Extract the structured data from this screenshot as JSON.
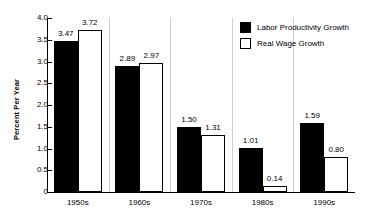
{
  "chart_data": {
    "type": "bar",
    "title": "",
    "subtitle": "",
    "xlabel": "",
    "ylabel": "Percent Per Year",
    "ylim": [
      0,
      4.0
    ],
    "ytick_values": [
      4.0,
      3.5,
      3.0,
      2.5,
      2.0,
      1.5,
      1.0,
      0.5,
      0
    ],
    "ytick_labels": [
      "4.0",
      "3.5",
      "3.0",
      "2.5",
      "2.0",
      "1.5",
      "1.0",
      "0.5",
      "0"
    ],
    "grid": false,
    "legend_position": "top-right",
    "categories": [
      "1950s",
      "1960s",
      "1970s",
      "1980s",
      "1990s"
    ],
    "series": [
      {
        "name": "Labor Productivity Growth",
        "color": "#000000",
        "fill": "solid",
        "values": [
          3.47,
          2.89,
          1.5,
          1.01,
          1.59
        ],
        "labels": [
          "3.47",
          "2.89",
          "1.50",
          "1.01",
          "1.59"
        ]
      },
      {
        "name": "Real Wage Growth",
        "color": "#ffffff",
        "fill": "outline",
        "values": [
          3.72,
          2.97,
          1.31,
          0.14,
          0.8
        ],
        "labels": [
          "3.72",
          "2.97",
          "1.31",
          "0.14",
          "0.80"
        ]
      }
    ]
  },
  "legend": {
    "items": [
      {
        "label": "Labor Productivity Growth",
        "swatch": "dark"
      },
      {
        "label": "Real Wage Growth",
        "swatch": "light"
      }
    ]
  },
  "colors": {
    "axis": "#000000",
    "series_1": "#000000",
    "series_2": "#ffffff",
    "background": "#ffffff",
    "separator": "#cfcfcf"
  }
}
